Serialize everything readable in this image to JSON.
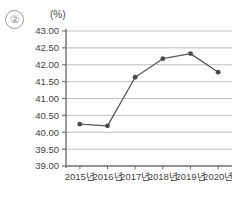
{
  "item_marker": "②",
  "unit_label": "(%)",
  "chart_data": {
    "type": "line",
    "title": "",
    "subtitle": "",
    "xlabel": "",
    "ylabel": "",
    "unit": "(%)",
    "categories": [
      "2015년",
      "2016년",
      "2017년",
      "2018년",
      "2019년",
      "2020년"
    ],
    "values": [
      40.24,
      40.19,
      41.63,
      42.18,
      42.33,
      41.78
    ],
    "series": [
      {
        "name": "",
        "values": [
          40.24,
          40.19,
          41.63,
          42.18,
          42.33,
          41.78
        ]
      }
    ],
    "ylim": [
      39.0,
      43.0
    ],
    "ystep": 0.5,
    "ytick_labels": [
      "43.00",
      "42.50",
      "42.00",
      "41.50",
      "41.00",
      "40.50",
      "40.00",
      "39.50",
      "39.00"
    ],
    "ytick_values": [
      43.0,
      42.5,
      42.0,
      41.5,
      41.0,
      40.5,
      40.0,
      39.5,
      39.0
    ],
    "grid": true,
    "legend": "none",
    "marker": "circle",
    "colors": {
      "line": "#5a5a5a",
      "marker": "#4a4a4a",
      "grid": "#b9b9b9",
      "axis": "#6f6f6f",
      "text": "#3f3f3f"
    }
  }
}
